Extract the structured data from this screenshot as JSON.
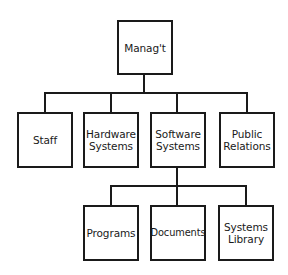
{
  "diagram": {
    "type": "org-chart",
    "root": {
      "label": "Manag't",
      "children": [
        {
          "label": "Staff"
        },
        {
          "label": "Hardware\nSystems"
        },
        {
          "label": "Software\nSystems",
          "children": [
            {
              "label": "Programs"
            },
            {
              "label": "Documents"
            },
            {
              "label": "Systems\nLibrary"
            }
          ]
        },
        {
          "label": "Public\nRelations"
        }
      ]
    }
  },
  "nodes": {
    "management": "Manag't",
    "staff": "Staff",
    "hardware_systems": "Hardware\nSystems",
    "software_systems": "Software\nSystems",
    "public_relations": "Public\nRelations",
    "programs": "Programs",
    "documents": "Documents",
    "systems_library": "Systems\nLibrary"
  }
}
